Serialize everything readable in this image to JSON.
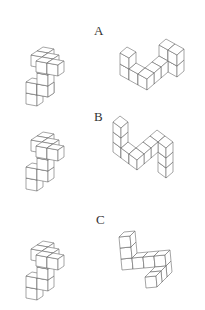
{
  "line_color": "#6a6a6a",
  "background": "#ffffff",
  "rows": [
    {
      "label": "A",
      "label_pos": [
        94,
        24
      ],
      "left_figure": {
        "origin": [
          26,
          93
        ],
        "r": [
          11,
          2
        ],
        "u": [
          0,
          -11
        ],
        "d": [
          6,
          -4
        ],
        "cubes": [
          [
            0,
            0,
            -1
          ],
          [
            0,
            0,
            0
          ],
          [
            1,
            0,
            0
          ],
          [
            1,
            0,
            0
          ],
          [
            1,
            0,
            1
          ],
          [
            1,
            0,
            2
          ],
          [
            1,
            0,
            3
          ],
          [
            1,
            -1,
            3
          ],
          [
            2,
            -1,
            3
          ],
          [
            2,
            -2,
            3
          ],
          [
            3,
            -2,
            3
          ]
        ]
      },
      "right_figure": {
        "origin": [
          120,
          75
        ],
        "r": [
          9,
          5
        ],
        "u": [
          0,
          -11
        ],
        "d": [
          7,
          -6
        ],
        "cubes": [
          [
            0,
            0,
            0
          ],
          [
            0,
            0,
            1
          ],
          [
            1,
            0,
            0
          ],
          [
            2,
            0,
            0
          ],
          [
            2,
            1,
            0
          ],
          [
            2,
            2,
            0
          ],
          [
            2,
            3,
            0
          ],
          [
            2,
            3,
            1
          ],
          [
            3,
            3,
            1
          ],
          [
            3,
            3,
            0
          ]
        ]
      }
    },
    {
      "label": "B",
      "label_pos": [
        94,
        110
      ],
      "left_figure": {
        "origin": [
          26,
          178
        ],
        "r": [
          11,
          2
        ],
        "u": [
          0,
          -11
        ],
        "d": [
          6,
          -4
        ],
        "cubes": [
          [
            0,
            0,
            -1
          ],
          [
            0,
            0,
            0
          ],
          [
            1,
            0,
            0
          ],
          [
            1,
            0,
            1
          ],
          [
            1,
            0,
            2
          ],
          [
            1,
            0,
            3
          ],
          [
            1,
            -1,
            3
          ],
          [
            2,
            -1,
            3
          ],
          [
            2,
            -2,
            3
          ],
          [
            3,
            -2,
            3
          ]
        ]
      },
      "right_figure": {
        "origin": [
          113,
          152
        ],
        "r": [
          8,
          6
        ],
        "u": [
          0,
          -10
        ],
        "d": [
          7,
          -6
        ],
        "cubes": [
          [
            0,
            0,
            0
          ],
          [
            0,
            0,
            1
          ],
          [
            0,
            0,
            2
          ],
          [
            1,
            0,
            0
          ],
          [
            2,
            0,
            0
          ],
          [
            2,
            1,
            0
          ],
          [
            2,
            2,
            0
          ],
          [
            2,
            3,
            0
          ],
          [
            3,
            3,
            0
          ],
          [
            3,
            3,
            -1
          ],
          [
            3,
            3,
            -2
          ]
        ]
      }
    },
    {
      "label": "C",
      "label_pos": [
        96,
        213
      ],
      "left_figure": {
        "origin": [
          26,
          287
        ],
        "r": [
          11,
          2
        ],
        "u": [
          0,
          -11
        ],
        "d": [
          6,
          -4
        ],
        "cubes": [
          [
            0,
            0,
            -1
          ],
          [
            0,
            0,
            0
          ],
          [
            1,
            0,
            0
          ],
          [
            1,
            0,
            1
          ],
          [
            1,
            0,
            2
          ],
          [
            1,
            0,
            3
          ],
          [
            1,
            -1,
            3
          ],
          [
            2,
            -1,
            3
          ],
          [
            2,
            -2,
            3
          ],
          [
            3,
            -2,
            3
          ]
        ]
      },
      "right_figure": {
        "origin": [
          122,
          270
        ],
        "r": [
          11,
          -1
        ],
        "u": [
          -1,
          -11
        ],
        "d": [
          5,
          -5
        ],
        "cubes": [
          [
            0,
            0,
            0
          ],
          [
            0,
            0,
            1
          ],
          [
            0,
            0,
            2
          ],
          [
            1,
            0,
            0
          ],
          [
            2,
            0,
            0
          ],
          [
            3,
            0,
            0
          ],
          [
            3,
            0,
            -1
          ],
          [
            3,
            -1,
            -1
          ],
          [
            3,
            -2,
            -1
          ]
        ]
      }
    }
  ]
}
